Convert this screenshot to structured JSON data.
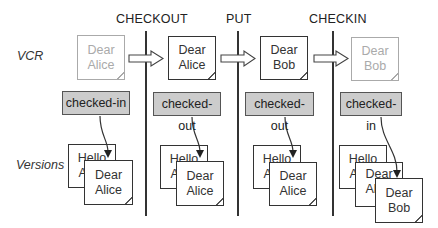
{
  "headers": [
    "CHECKOUT",
    "PUT",
    "CHECKIN"
  ],
  "row_labels": {
    "vcr": "VCR",
    "versions": "Versions"
  },
  "vcr_docs": [
    {
      "line1": "Dear",
      "line2": "Alice",
      "faded": true
    },
    {
      "line1": "Dear",
      "line2": "Alice",
      "faded": false
    },
    {
      "line1": "Dear",
      "line2": "Bob",
      "faded": false
    },
    {
      "line1": "Dear",
      "line2": "Bob",
      "faded": true
    }
  ],
  "statuses": [
    "checked-in",
    "checked-out",
    "checked-out",
    "checked-in"
  ],
  "versions": {
    "col1": {
      "back": {
        "line1": "Hello",
        "line2": "Alice"
      },
      "front": {
        "line1": "Dear",
        "line2": "Alice"
      }
    },
    "col2": {
      "back": {
        "line1": "Hello",
        "line2": "Alice"
      },
      "front": {
        "line1": "Dear",
        "line2": "Alice"
      }
    },
    "col3": {
      "back": {
        "line1": "Hello",
        "line2": "Alice"
      },
      "front": {
        "line1": "Dear",
        "line2": "Alice"
      }
    },
    "col4": {
      "back": {
        "line1": "Hello",
        "line2": "Alice"
      },
      "middle": {
        "line1": "Dear",
        "line2": "Alice"
      },
      "front": {
        "line1": "Dear",
        "line2": "Bob"
      }
    }
  }
}
